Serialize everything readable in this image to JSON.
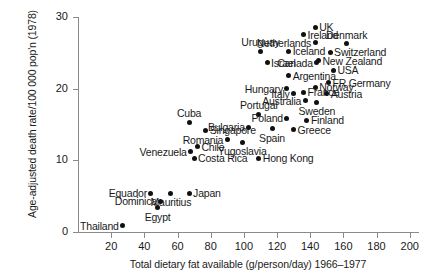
{
  "chart_data": {
    "type": "scatter",
    "title": "",
    "xlabel": "Total dietary fat available (g/person/day) 1966–1977",
    "ylabel": "Age-adjusted death rate/100 000 pop'n (1978)",
    "xlim": [
      0,
      205
    ],
    "ylim": [
      0,
      30
    ],
    "xticks": [
      20,
      40,
      60,
      80,
      100,
      120,
      140,
      160,
      180,
      200
    ],
    "xtick_labels": [
      "20",
      "40",
      "60",
      "80",
      "100",
      "120",
      "140",
      "160",
      "180",
      "200"
    ],
    "yticks": [
      0,
      10,
      20,
      30
    ],
    "ytick_labels": [
      "0",
      "10",
      "20",
      "30"
    ],
    "grid": false,
    "legend": null,
    "marker": "filled-circle",
    "marker_color": "#111111",
    "points": [
      {
        "label": "UK",
        "x": 143,
        "y": 28.6,
        "label_pos": "right"
      },
      {
        "label": "Ireland",
        "x": 136,
        "y": 27.5,
        "label_pos": "right"
      },
      {
        "label": "Denmark",
        "x": 162,
        "y": 26.3,
        "label_pos": "center-above"
      },
      {
        "label": "Netherlands",
        "x": 143,
        "y": 26.4,
        "label_pos": "left"
      },
      {
        "label": "Uruguay",
        "x": 110,
        "y": 25.2,
        "label_pos": "center-above"
      },
      {
        "label": "Iceland",
        "x": 127,
        "y": 25.2,
        "label_pos": "right"
      },
      {
        "label": "Switzerland",
        "x": 152,
        "y": 25.1,
        "label_pos": "right"
      },
      {
        "label": "New Zealand",
        "x": 145,
        "y": 23.9,
        "label_pos": "right"
      },
      {
        "label": "Canada",
        "x": 144,
        "y": 23.6,
        "label_pos": "left"
      },
      {
        "label": "Israel",
        "x": 114,
        "y": 23.6,
        "label_pos": "right"
      },
      {
        "label": "USA",
        "x": 154,
        "y": 22.6,
        "label_pos": "right"
      },
      {
        "label": "Argentina",
        "x": 127,
        "y": 21.8,
        "label_pos": "right"
      },
      {
        "label": "FR Germany",
        "x": 151,
        "y": 20.8,
        "label_pos": "right"
      },
      {
        "label": "Hungary",
        "x": 126,
        "y": 20.0,
        "label_pos": "left"
      },
      {
        "label": "Norway",
        "x": 143,
        "y": 20.2,
        "label_pos": "right"
      },
      {
        "label": "Italy",
        "x": 130,
        "y": 19.3,
        "label_pos": "left"
      },
      {
        "label": "France",
        "x": 136,
        "y": 19.5,
        "label_pos": "right"
      },
      {
        "label": "Austria",
        "x": 150,
        "y": 19.3,
        "label_pos": "right"
      },
      {
        "label": "Australia",
        "x": 137,
        "y": 18.3,
        "label_pos": "left"
      },
      {
        "label": "Sweden",
        "x": 144,
        "y": 18.1,
        "label_pos": "center-below"
      },
      {
        "label": "Portugal",
        "x": 109,
        "y": 16.4,
        "label_pos": "center-above"
      },
      {
        "label": "Poland",
        "x": 126,
        "y": 15.9,
        "label_pos": "left"
      },
      {
        "label": "Finland",
        "x": 138,
        "y": 15.6,
        "label_pos": "right"
      },
      {
        "label": "Cuba",
        "x": 67,
        "y": 15.3,
        "label_pos": "center-above"
      },
      {
        "label": "Singapore",
        "x": 77,
        "y": 14.2,
        "label_pos": "right"
      },
      {
        "label": "Bulgaria",
        "x": 103,
        "y": 14.6,
        "label_pos": "left"
      },
      {
        "label": "Spain",
        "x": 117,
        "y": 14.4,
        "label_pos": "center-below"
      },
      {
        "label": "Greece",
        "x": 130,
        "y": 14.3,
        "label_pos": "right"
      },
      {
        "label": "Romania",
        "x": 90,
        "y": 12.9,
        "label_pos": "left"
      },
      {
        "label": "Chile",
        "x": 72,
        "y": 11.9,
        "label_pos": "right"
      },
      {
        "label": "Yugoslavia",
        "x": 99,
        "y": 12.5,
        "label_pos": "center-below"
      },
      {
        "label": "Venezuela",
        "x": 68,
        "y": 11.2,
        "label_pos": "left"
      },
      {
        "label": "Costa Rica",
        "x": 70,
        "y": 10.3,
        "label_pos": "right"
      },
      {
        "label": "Hong Kong",
        "x": 109,
        "y": 10.3,
        "label_pos": "right"
      },
      {
        "label": "Equador",
        "x": 44,
        "y": 5.4,
        "label_pos": "left"
      },
      {
        "label": "Japan",
        "x": 67,
        "y": 5.4,
        "label_pos": "right"
      },
      {
        "label": "Mauritius",
        "x": 56,
        "y": 5.4,
        "label_pos": "center-below"
      },
      {
        "label": "Dominica",
        "x": 50,
        "y": 4.3,
        "label_pos": "left"
      },
      {
        "label": "Egypt",
        "x": 48,
        "y": 3.4,
        "label_pos": "center-below"
      },
      {
        "label": "Thailand",
        "x": 27,
        "y": 0.9,
        "label_pos": "left"
      }
    ]
  }
}
